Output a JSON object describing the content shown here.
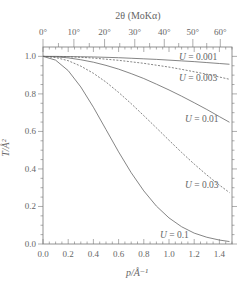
{
  "chart_data": {
    "type": "line",
    "title": "",
    "top_axis": {
      "label": "2θ (MoKα)",
      "tick_labels": [
        "0°",
        "10°",
        "20°",
        "30°",
        "40°",
        "50°",
        "60°"
      ],
      "tick_values_deg": [
        0,
        10,
        20,
        30,
        40,
        50,
        60
      ],
      "wavelength_A": 0.7107
    },
    "xlabel": "p/Å⁻¹",
    "ylabel": "T/Å²",
    "xlim": [
      0.0,
      1.5
    ],
    "ylim": [
      0.0,
      1.05
    ],
    "x_ticks": [
      0.0,
      0.2,
      0.4,
      0.6,
      0.8,
      1.0,
      1.2,
      1.4
    ],
    "x_tick_labels": [
      "0.0",
      "0.2",
      "0.4",
      "0.6",
      "0.8",
      "1.0",
      "1.2",
      "1.4"
    ],
    "y_ticks": [
      0.0,
      0.2,
      0.4,
      0.6,
      0.8,
      1.0
    ],
    "y_tick_labels": [
      "0.0",
      "0.2",
      "0.4",
      "0.6",
      "0.8",
      "1.0"
    ],
    "grid": false,
    "legend": "inline labels near right end of curves",
    "x": [
      0.0,
      0.1,
      0.2,
      0.3,
      0.4,
      0.5,
      0.6,
      0.7,
      0.8,
      0.9,
      1.0,
      1.1,
      1.2,
      1.3,
      1.4,
      1.48
    ],
    "series": [
      {
        "name": "U = 0.001",
        "label": "U = 0.001",
        "style": "solid",
        "values": [
          1.0,
          1.0,
          0.999,
          0.998,
          0.997,
          0.995,
          0.993,
          0.99,
          0.987,
          0.984,
          0.98,
          0.976,
          0.972,
          0.967,
          0.962,
          0.958
        ]
      },
      {
        "name": "U = 0.003",
        "label": "U = 0.003",
        "style": "dashed",
        "values": [
          1.0,
          0.999,
          0.998,
          0.995,
          0.991,
          0.985,
          0.979,
          0.971,
          0.963,
          0.953,
          0.943,
          0.931,
          0.918,
          0.905,
          0.89,
          0.878
        ]
      },
      {
        "name": "U = 0.01",
        "label": "U = 0.01",
        "style": "solid",
        "values": [
          1.0,
          0.998,
          0.992,
          0.982,
          0.969,
          0.952,
          0.932,
          0.908,
          0.882,
          0.852,
          0.821,
          0.788,
          0.753,
          0.717,
          0.679,
          0.649
        ]
      },
      {
        "name": "U = 0.03",
        "label": "U = 0.03",
        "style": "dashed",
        "values": [
          1.0,
          0.994,
          0.977,
          0.948,
          0.91,
          0.863,
          0.808,
          0.748,
          0.684,
          0.619,
          0.553,
          0.488,
          0.426,
          0.368,
          0.314,
          0.274
        ]
      },
      {
        "name": "U = 0.1",
        "label": "U = 0.1",
        "style": "solid",
        "values": [
          1.0,
          0.98,
          0.924,
          0.837,
          0.729,
          0.61,
          0.491,
          0.38,
          0.283,
          0.202,
          0.139,
          0.092,
          0.058,
          0.036,
          0.021,
          0.013
        ]
      }
    ]
  },
  "labels": {
    "top_axis_title": "2θ (MoKα)",
    "x_axis_title": "p/Å⁻¹",
    "y_axis_title": "T/Å²"
  }
}
